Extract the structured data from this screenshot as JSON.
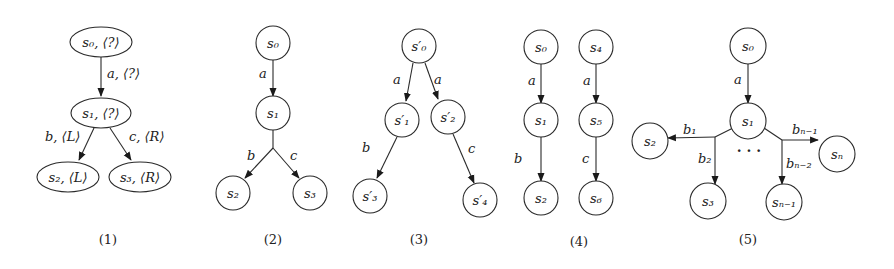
{
  "figure": {
    "panels": [
      {
        "caption": "(1)",
        "nodes": {
          "s0": "s₀, ⟨?⟩",
          "s1": "s₁, ⟨?⟩",
          "s2": "s₂, ⟨L⟩",
          "s3": "s₃, ⟨R⟩"
        },
        "edges": {
          "s0_s1": "a, ⟨?⟩",
          "s1_s2": "b, ⟨L⟩",
          "s1_s3": "c, ⟨R⟩"
        }
      },
      {
        "caption": "(2)",
        "nodes": {
          "s0": "s₀",
          "s1": "s₁",
          "s2": "s₂",
          "s3": "s₃"
        },
        "edges": {
          "s0_s1": "a",
          "s1_s2": "b",
          "s1_s3": "c"
        }
      },
      {
        "caption": "(3)",
        "nodes": {
          "s0": "s′₀",
          "s1": "s′₁",
          "s2": "s′₂",
          "s3": "s′₃",
          "s4": "s′₄"
        },
        "edges": {
          "s0_s1": "a",
          "s0_s2": "a",
          "s1_s3": "b",
          "s2_s4": "c"
        }
      },
      {
        "caption": "(4)",
        "nodes": {
          "s0": "s₀",
          "s1": "s₁",
          "s2": "s₂",
          "s4": "s₄",
          "s5": "s₅",
          "s6": "s₆"
        },
        "edges": {
          "s0_s1": "a",
          "s1_s2": "b",
          "s4_s5": "a",
          "s5_s6": "c"
        }
      },
      {
        "caption": "(5)",
        "nodes": {
          "s0": "s₀",
          "s1": "s₁",
          "s2": "s₂",
          "s3": "s₃",
          "sn1": "sₙ₋₁",
          "sn": "sₙ"
        },
        "edges": {
          "s0_s1": "a",
          "s1_s2": "b₁",
          "s1_s3": "b₂",
          "s1_sn1": "bₙ₋₂",
          "s1_sn": "bₙ₋₁"
        },
        "ellipsis": "· · ·"
      }
    ]
  }
}
